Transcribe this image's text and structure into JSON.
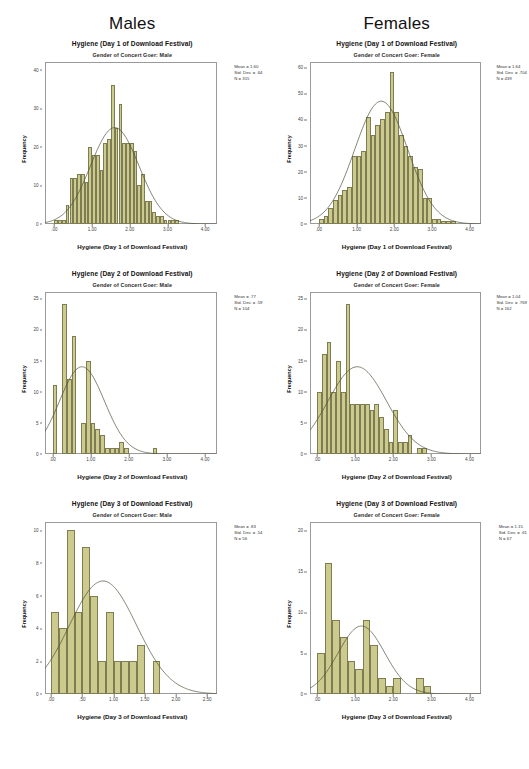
{
  "headings": {
    "left": "Males",
    "right": "Females"
  },
  "colors": {
    "bar_fill": "#ccca8c",
    "bar_stroke": "#7d7c52",
    "curve": "#4d5239",
    "frame": "#9a9a9a",
    "text": "#111111"
  },
  "common": {
    "y_axis_title": "Frequency"
  },
  "chart_data": [
    {
      "id": "males-day1",
      "type": "bar",
      "title": "Hygiene (Day 1 of Download Festival)",
      "subtitle": "Gender of Concert Goer: Male",
      "xlabel": "Hygiene (Day 1 of Download Festival)",
      "ylabel": "Frequency",
      "xlim": [
        -0.25,
        4.3
      ],
      "ylim": [
        0,
        42
      ],
      "xticks": [
        ".00",
        "1.00",
        "2.00",
        "3.00",
        "4.00"
      ],
      "xtick_values": [
        0,
        1,
        2,
        3,
        4
      ],
      "yticks": [
        "0",
        "10",
        "20",
        "30",
        "40"
      ],
      "ytick_values": [
        0,
        10,
        20,
        30,
        40
      ],
      "grid": false,
      "bin_width": 0.1,
      "bin_starts": [
        0.0,
        0.1,
        0.2,
        0.3,
        0.4,
        0.5,
        0.6,
        0.7,
        0.8,
        0.9,
        1.0,
        1.1,
        1.2,
        1.3,
        1.4,
        1.5,
        1.6,
        1.7,
        1.8,
        1.9,
        2.0,
        2.1,
        2.2,
        2.3,
        2.4,
        2.5,
        2.6,
        2.7,
        2.8,
        2.9,
        3.0,
        3.1,
        3.2,
        3.3,
        3.4,
        3.5,
        3.6,
        3.7
      ],
      "values": [
        1,
        1,
        1,
        5,
        12,
        12,
        13,
        13,
        11,
        20,
        18,
        18,
        14,
        21,
        22,
        36,
        25,
        31,
        21,
        21,
        21,
        19,
        10,
        13,
        6,
        6,
        3,
        2,
        2,
        1,
        1,
        1,
        1,
        0,
        0,
        0,
        0,
        0
      ],
      "curve": {
        "type": "normal",
        "mean": 1.6,
        "sd": 0.64,
        "n": 315,
        "peak": 25
      },
      "stats": {
        "mean_label": "Mean = 1.60",
        "sd_label": "Std. Dev. = .64",
        "n_label": "N = 315"
      }
    },
    {
      "id": "females-day1",
      "type": "bar",
      "title": "Hygiene (Day 1 of Download Festival)",
      "subtitle": "Gender of Concert Goer: Female",
      "xlabel": "Hygiene (Day 1 of Download Festival)",
      "ylabel": "Frequency",
      "xlim": [
        -0.25,
        4.3
      ],
      "ylim": [
        0,
        62
      ],
      "xticks": [
        ".00",
        "1.00",
        "2.00",
        "3.00",
        "4.00"
      ],
      "xtick_values": [
        0,
        1,
        2,
        3,
        4
      ],
      "yticks": [
        "0",
        "10",
        "20",
        "30",
        "40",
        "50",
        "60"
      ],
      "ytick_values": [
        0,
        10,
        20,
        30,
        40,
        50,
        60
      ],
      "grid": false,
      "bin_width": 0.125,
      "bin_starts": [
        0.0,
        0.125,
        0.25,
        0.375,
        0.5,
        0.625,
        0.75,
        0.875,
        1.0,
        1.125,
        1.25,
        1.375,
        1.5,
        1.625,
        1.75,
        1.875,
        2.0,
        2.125,
        2.25,
        2.375,
        2.5,
        2.625,
        2.75,
        2.875,
        3.0,
        3.125,
        3.25,
        3.375,
        3.5,
        3.625,
        3.75
      ],
      "values": [
        2,
        3,
        6,
        9,
        11,
        13,
        14,
        26,
        26,
        28,
        41,
        34,
        38,
        40,
        43,
        58,
        43,
        34,
        30,
        26,
        22,
        21,
        10,
        10,
        2,
        2,
        1,
        1,
        1,
        0,
        0
      ],
      "curve": {
        "type": "normal",
        "mean": 1.64,
        "sd": 0.704,
        "n": 439,
        "peak": 47
      },
      "stats": {
        "mean_label": "Mean = 1.64",
        "sd_label": "Std. Dev. = .704",
        "n_label": "N = 439"
      }
    },
    {
      "id": "males-day2",
      "type": "bar",
      "title": "Hygiene (Day 2 of Download Festival)",
      "subtitle": "Gender of Concert Goer: Male",
      "xlabel": "Hygiene (Day 2 of Download Festival)",
      "ylabel": "Frequency",
      "xlim": [
        -0.2,
        4.3
      ],
      "ylim": [
        0,
        26
      ],
      "xticks": [
        ".00",
        "1.00",
        "2.00",
        "3.00",
        "4.00"
      ],
      "xtick_values": [
        0,
        1,
        2,
        3,
        4
      ],
      "yticks": [
        "0",
        "5",
        "10",
        "15",
        "20",
        "25"
      ],
      "ytick_values": [
        0,
        5,
        10,
        15,
        20,
        25
      ],
      "grid": false,
      "bin_width": 0.125,
      "bin_starts": [
        0.0,
        0.125,
        0.25,
        0.375,
        0.5,
        0.625,
        0.75,
        0.875,
        1.0,
        1.125,
        1.25,
        1.375,
        1.5,
        1.625,
        1.75,
        1.875,
        2.0,
        2.125,
        2.25,
        2.375,
        2.5,
        2.625,
        2.75,
        2.875,
        3.0,
        3.125,
        3.25,
        3.375,
        3.5
      ],
      "values": [
        11,
        0,
        24,
        12,
        19,
        0,
        5,
        15,
        5,
        4,
        3,
        1,
        1,
        1,
        2,
        1,
        0,
        0,
        0,
        0,
        0,
        1,
        0,
        0,
        0,
        0,
        0,
        0,
        0
      ],
      "curve": {
        "type": "normal",
        "mean": 0.77,
        "sd": 0.59,
        "n": 104,
        "peak": 14
      },
      "stats": {
        "mean_label": "Mean = .77",
        "sd_label": "Std. Dev. = .59",
        "n_label": "N = 104"
      }
    },
    {
      "id": "females-day2",
      "type": "bar",
      "title": "Hygiene (Day 2 of Download Festival)",
      "subtitle": "Gender of Concert Goer: Female",
      "xlabel": "Hygiene (Day 2 of Download Festival)",
      "ylabel": "Frequency",
      "xlim": [
        -0.2,
        4.3
      ],
      "ylim": [
        0,
        26
      ],
      "xticks": [
        ".00",
        "1.00",
        "2.00",
        "3.00",
        "4.00"
      ],
      "xtick_values": [
        0,
        1,
        2,
        3,
        4
      ],
      "yticks": [
        "0",
        "5",
        "10",
        "15",
        "20",
        "25"
      ],
      "ytick_values": [
        0,
        5,
        10,
        15,
        20,
        25
      ],
      "grid": false,
      "bin_width": 0.125,
      "bin_starts": [
        0.0,
        0.125,
        0.25,
        0.375,
        0.5,
        0.625,
        0.75,
        0.875,
        1.0,
        1.125,
        1.25,
        1.375,
        1.5,
        1.625,
        1.75,
        1.875,
        2.0,
        2.125,
        2.25,
        2.375,
        2.5,
        2.625,
        2.75,
        2.875,
        3.0,
        3.125,
        3.25,
        3.375,
        3.5
      ],
      "values": [
        10,
        16,
        18,
        10,
        15,
        10,
        24,
        8,
        8,
        8,
        8,
        7,
        8,
        6,
        4,
        2,
        7,
        2,
        2,
        3,
        0,
        1,
        1,
        0,
        0,
        0,
        0,
        0,
        0
      ],
      "curve": {
        "type": "normal",
        "mean": 1.04,
        "sd": 0.769,
        "n": 162,
        "peak": 14
      },
      "stats": {
        "mean_label": "Mean = 1.04",
        "sd_label": "Std. Dev. = .769",
        "n_label": "N = 162"
      }
    },
    {
      "id": "males-day3",
      "type": "bar",
      "title": "Hygiene (Day 3 of Download Festival)",
      "subtitle": "Gender of Concert Goer: Male",
      "xlabel": "Hygiene (Day 3 of Download Festival)",
      "ylabel": "Frequency",
      "xlim": [
        -0.1,
        2.65
      ],
      "ylim": [
        0,
        10.5
      ],
      "xticks": [
        ".00",
        ".50",
        "1.00",
        "1.50",
        "2.00",
        "2.50"
      ],
      "xtick_values": [
        0,
        0.5,
        1.0,
        1.5,
        2.0,
        2.5
      ],
      "yticks": [
        "0",
        "2",
        "4",
        "6",
        "8",
        "10"
      ],
      "ytick_values": [
        0,
        2,
        4,
        6,
        8,
        10
      ],
      "grid": false,
      "bin_width": 0.125,
      "bin_starts": [
        0.0,
        0.125,
        0.25,
        0.375,
        0.5,
        0.625,
        0.75,
        0.875,
        1.0,
        1.125,
        1.25,
        1.375,
        1.5,
        1.625,
        1.75,
        1.875,
        2.0,
        2.125
      ],
      "values": [
        5,
        4,
        10,
        5,
        9,
        6,
        2,
        5,
        2,
        2,
        2,
        3,
        0,
        2,
        0,
        0,
        0,
        0
      ],
      "curve": {
        "type": "normal",
        "mean": 0.83,
        "sd": 0.54,
        "n": 56,
        "peak": 6.9
      },
      "stats": {
        "mean_label": "Mean = .83",
        "sd_label": "Std. Dev. = .54",
        "n_label": "N = 56"
      }
    },
    {
      "id": "females-day3",
      "type": "bar",
      "title": "Hygiene (Day 3 of Download Festival)",
      "subtitle": "Gender of Concert Goer: Female",
      "xlabel": "Hygiene (Day 3 of Download Festival)",
      "ylabel": "Frequency",
      "xlim": [
        -0.2,
        4.3
      ],
      "ylim": [
        0,
        21
      ],
      "xticks": [
        ".00",
        "1.00",
        "2.00",
        "3.00",
        "4.00"
      ],
      "xtick_values": [
        0,
        1,
        2,
        3,
        4
      ],
      "yticks": [
        "0",
        "5",
        "10",
        "15",
        "20"
      ],
      "ytick_values": [
        0,
        5,
        10,
        15,
        20
      ],
      "grid": false,
      "bin_width": 0.2,
      "bin_starts": [
        0.0,
        0.2,
        0.4,
        0.6,
        0.8,
        1.0,
        1.2,
        1.4,
        1.6,
        1.8,
        2.0,
        2.2,
        2.4,
        2.6,
        2.8,
        3.0,
        3.2,
        3.4,
        3.6
      ],
      "values": [
        5,
        16,
        9,
        7,
        4,
        3,
        9,
        6,
        2,
        1,
        2,
        0,
        0,
        2,
        1,
        0,
        0,
        0,
        0
      ],
      "curve": {
        "type": "normal",
        "mean": 1.15,
        "sd": 0.61,
        "n": 67,
        "peak": 8.3
      },
      "stats": {
        "mean_label": "Mean = 1.15",
        "sd_label": "Std. Dev. = .61",
        "n_label": "N = 67"
      }
    }
  ]
}
